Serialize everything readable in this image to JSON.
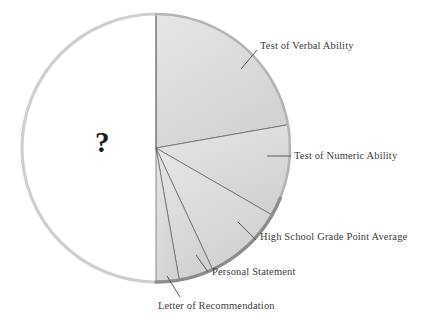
{
  "figure": {
    "type": "pie-chart",
    "unknown_marker": "?",
    "background_color": "#ffffff"
  },
  "chart_data": {
    "type": "pie",
    "title": "",
    "subtitle": "",
    "xlabel": "",
    "ylabel": "",
    "legend_position": "callout-labels",
    "grid": false,
    "center": {
      "x": 156,
      "y": 148
    },
    "radius": 134,
    "unknown_slice_label": "?",
    "categories": [
      "Test of Verbal Ability",
      "Test of Numeric Ability",
      "High School Grade Point Average",
      "Personal Statement",
      "Letter of Recommendation",
      "?"
    ],
    "values": [
      22.2,
      11.1,
      9.7,
      4.2,
      2.8,
      50.0
    ],
    "slices": [
      {
        "label": "Test of Verbal Ability",
        "value": 22.2,
        "start_angle": 0,
        "end_angle": 80,
        "fill": "#e2e2e2",
        "leader": {
          "x1": 241,
          "y1": 69,
          "x2": 257,
          "y2": 50
        },
        "text_x": 260,
        "text_y": 40
      },
      {
        "label": "Test of Numeric Ability",
        "value": 11.1,
        "start_angle": 80,
        "end_angle": 120,
        "fill": "#dcdcdc",
        "leader": {
          "x1": 267,
          "y1": 156,
          "x2": 291,
          "y2": 156
        },
        "text_x": 294,
        "text_y": 150
      },
      {
        "label": "High School Grade Point Average",
        "value": 9.7,
        "start_angle": 120,
        "end_angle": 155,
        "fill": "#d8d8d8",
        "leader": {
          "x1": 238,
          "y1": 222,
          "x2": 256,
          "y2": 240
        },
        "text_x": 260,
        "text_y": 231
      },
      {
        "label": "Personal Statement",
        "value": 4.2,
        "start_angle": 155,
        "end_angle": 170,
        "fill": "#d4d4d4",
        "leader": {
          "x1": 196,
          "y1": 255,
          "x2": 208,
          "y2": 272
        },
        "text_x": 212,
        "text_y": 266
      },
      {
        "label": "Letter of Recommendation",
        "value": 2.8,
        "start_angle": 170,
        "end_angle": 180,
        "fill": "#d0d0d0",
        "leader": {
          "x1": 167,
          "y1": 276,
          "x2": 180,
          "y2": 297
        },
        "text_x": 158,
        "text_y": 300
      },
      {
        "label": "?",
        "value": 50.0,
        "start_angle": 180,
        "end_angle": 360,
        "fill": "#ffffff",
        "leader": null,
        "text_x": 95,
        "text_y": 128
      }
    ],
    "colors": {
      "slice_fill_light": "#e2e2e2",
      "slice_fill_dark": "#d0d0d0",
      "empty_fill": "#ffffff",
      "rim_light": "#cfcfcf",
      "rim_dark": "#8c8c8c",
      "divider_line": "#5a5a5a",
      "leader_line": "#4a4a4a",
      "label_text": "#3c3c3c"
    }
  }
}
